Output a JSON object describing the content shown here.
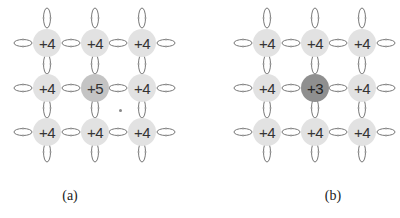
{
  "panels": [
    {
      "id": "a",
      "caption": "(a)",
      "offset_x": 0,
      "grid": [
        [
          "+4",
          "+4",
          "+4"
        ],
        [
          "+4",
          "+5",
          "+4"
        ],
        [
          "+4",
          "+4",
          "+4"
        ]
      ],
      "highlight": {
        "row": 1,
        "col": 1,
        "class": "hl-a"
      },
      "has_dot": true
    },
    {
      "id": "b",
      "caption": "(b)",
      "offset_x": 220,
      "grid": [
        [
          "+4",
          "+4",
          "+4"
        ],
        [
          "+4",
          "+3",
          "+4"
        ],
        [
          "+4",
          "+4",
          "+4"
        ]
      ],
      "highlight": {
        "row": 1,
        "col": 1,
        "class": "hl-b"
      },
      "has_dot": false
    }
  ],
  "colors": {
    "node": "#e2e2e2",
    "highlight_a": "#c4c4c4",
    "highlight_b": "#8f8f8f",
    "link": "#777777"
  }
}
